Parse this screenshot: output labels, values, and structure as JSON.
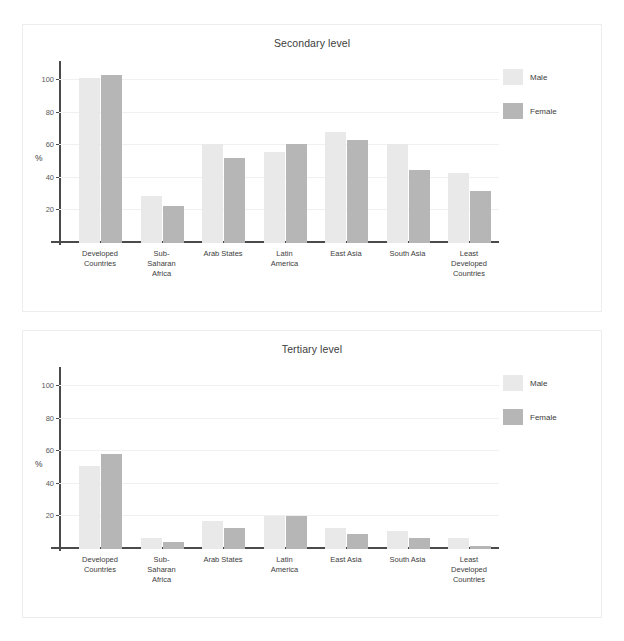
{
  "figure": {
    "background": "#ffffff",
    "panel_border_color": "#ededed"
  },
  "colors": {
    "male": "#e9e9e9",
    "female": "#b6b6b6",
    "axis": "#4a4a4a",
    "grid": "#f0f0f0",
    "text": "#3d3d3d"
  },
  "legend": {
    "male_label": "Male",
    "female_label": "Female"
  },
  "axis": {
    "y_title": "%",
    "tick_labels": [
      "20",
      "40",
      "60",
      "80",
      "100"
    ]
  },
  "categories": [
    "Developed Countries",
    "Sub-Saharan Africa",
    "Arab States",
    "Latin America",
    "East Asia",
    "South Asia",
    "Least Developed Countries"
  ],
  "category_lines": [
    [
      "Developed",
      "Countries"
    ],
    [
      "Sub-",
      "Saharan",
      "Africa"
    ],
    [
      "Arab States"
    ],
    [
      "Latin",
      "America"
    ],
    [
      "East Asia"
    ],
    [
      "South Asia"
    ],
    [
      "Least",
      "Developed",
      "Countries"
    ]
  ],
  "panels": {
    "secondary": {
      "title": "Secondary level"
    },
    "tertiary": {
      "title": "Tertiary level"
    }
  },
  "chart_data": [
    {
      "type": "bar",
      "title": "Secondary level",
      "xlabel": "",
      "ylabel": "%",
      "ylim": [
        0,
        108
      ],
      "yticks": [
        20,
        40,
        60,
        80,
        100
      ],
      "grid": true,
      "legend": "right",
      "categories": [
        "Developed Countries",
        "Sub-Saharan Africa",
        "Arab States",
        "Latin America",
        "East Asia",
        "South Asia",
        "Least Developed Countries"
      ],
      "series": [
        {
          "name": "Male",
          "values": [
            101,
            29,
            61,
            56,
            68,
            61,
            43
          ]
        },
        {
          "name": "Female",
          "values": [
            103,
            23,
            52,
            61,
            63,
            45,
            32
          ]
        }
      ]
    },
    {
      "type": "bar",
      "title": "Tertiary level",
      "xlabel": "",
      "ylabel": "%",
      "ylim": [
        0,
        108
      ],
      "yticks": [
        20,
        40,
        60,
        80,
        100
      ],
      "grid": true,
      "legend": "right",
      "categories": [
        "Developed Countries",
        "Sub-Saharan Africa",
        "Arab States",
        "Latin America",
        "East Asia",
        "South Asia",
        "Least Developed Countries"
      ],
      "series": [
        {
          "name": "Male",
          "values": [
            51,
            7,
            17,
            20,
            13,
            11,
            7
          ]
        },
        {
          "name": "Female",
          "values": [
            58,
            4,
            13,
            20,
            9,
            7,
            2
          ]
        }
      ]
    }
  ]
}
